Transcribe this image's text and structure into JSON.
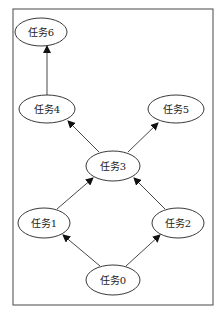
{
  "diagram": {
    "type": "directed-graph",
    "frame": {
      "x": 13,
      "y": 9,
      "width": 200,
      "height": 296,
      "stroke": "#666666"
    },
    "nodes": [
      {
        "id": "n0",
        "label": "任务0",
        "cx": 113,
        "cy": 280
      },
      {
        "id": "n1",
        "label": "任务1",
        "cx": 44,
        "cy": 223
      },
      {
        "id": "n2",
        "label": "任务2",
        "cx": 178,
        "cy": 223
      },
      {
        "id": "n3",
        "label": "任务3",
        "cx": 113,
        "cy": 166
      },
      {
        "id": "n4",
        "label": "任务4",
        "cx": 47,
        "cy": 109
      },
      {
        "id": "n5",
        "label": "任务5",
        "cx": 176,
        "cy": 109
      },
      {
        "id": "n6",
        "label": "任务6",
        "cx": 41,
        "cy": 32
      }
    ],
    "edges": [
      {
        "from": "任务0",
        "to": "任务1"
      },
      {
        "from": "任务0",
        "to": "任务2"
      },
      {
        "from": "任务1",
        "to": "任务3"
      },
      {
        "from": "任务2",
        "to": "任务3"
      },
      {
        "from": "任务3",
        "to": "任务4"
      },
      {
        "from": "任务3",
        "to": "任务5"
      },
      {
        "from": "任务4",
        "to": "任务6"
      }
    ]
  }
}
